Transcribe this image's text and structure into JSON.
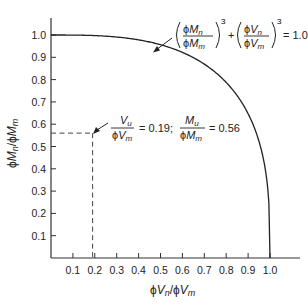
{
  "chart_data": {
    "type": "line",
    "title": "",
    "xlabel": "ϕVn/ϕVm",
    "ylabel": "ϕMn/ϕMm",
    "xlim": [
      0,
      1.15
    ],
    "ylim": [
      0,
      1.07
    ],
    "x_ticks": [
      "0.1",
      "0.2",
      "0.3",
      "0.4",
      "0.5",
      "0.6",
      "0.7",
      "0.8",
      "0.9",
      "1.0"
    ],
    "y_ticks": [
      "0.1",
      "0.2",
      "0.3",
      "0.4",
      "0.5",
      "0.6",
      "0.7",
      "0.8",
      "0.9",
      "1.0"
    ],
    "grid": false,
    "legend": null,
    "series": [
      {
        "name": "(ϕMn/ϕMm)^3 + (ϕVn/ϕVm)^3 = 1.0",
        "equation": "y = (1 - x^3)^(1/3)",
        "x": [
          0,
          0.1,
          0.2,
          0.3,
          0.4,
          0.5,
          0.6,
          0.7,
          0.8,
          0.9,
          0.95,
          0.98,
          1.0
        ],
        "y": [
          1.0,
          1.0,
          0.997,
          0.991,
          0.978,
          0.956,
          0.921,
          0.868,
          0.788,
          0.654,
          0.536,
          0.388,
          0.0
        ]
      }
    ],
    "annotations": [
      {
        "type": "equation-label",
        "text": "(ϕMn/ϕMm)^3 + (ϕVn/ϕVm)^3 = 1.0",
        "points_to": [
          0.48,
          0.96
        ]
      },
      {
        "type": "point-label",
        "text": "Vu/ϕVm = 0.19; Mu/ϕMm = 0.56",
        "point": [
          0.19,
          0.56
        ],
        "dashed_guides": true
      }
    ]
  },
  "labels": {
    "x_axis": {
      "phi1": "ϕ",
      "V1": "V",
      "n": "n",
      "slash": "/",
      "phi2": "ϕ",
      "V2": "V",
      "m": "m"
    },
    "y_axis": {
      "phi1": "ϕ",
      "M1": "M",
      "n": "n",
      "slash": "/",
      "phi2": "ϕ",
      "M2": "M",
      "m": "m"
    },
    "equation": {
      "phi": "ϕ",
      "M": "M",
      "V": "V",
      "n": "n",
      "m": "m",
      "exp": "3",
      "plus": "+",
      "equals": "= 1.0"
    },
    "point_note": {
      "Vu_num": "V",
      "Vu_sub": "u",
      "Vu_den_phi": "ϕ",
      "Vu_den": "V",
      "Vu_den_sub": "m",
      "Vu_value": "= 0.19;",
      "Mu_num": "M",
      "Mu_sub": "u",
      "Mu_den_phi": "ϕ",
      "Mu_den": "M",
      "Mu_den_sub": "m",
      "Mu_value": "= 0.56"
    }
  },
  "colors": {
    "axis": "#333333",
    "curve": "#222222",
    "guide": "#444444",
    "text": "#222222"
  }
}
